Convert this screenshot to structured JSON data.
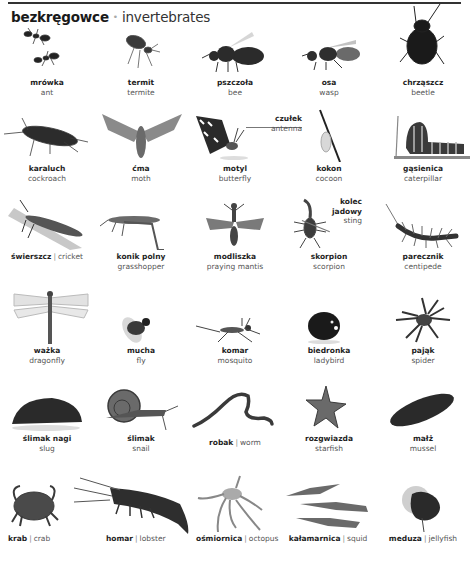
{
  "header": {
    "title_pl": "bezkręgowce",
    "bullet": "•",
    "title_en": "invertebrates"
  },
  "colors": {
    "text_primary": "#1e1e1e",
    "text_secondary": "#555555",
    "bullet": "#a9a9a9",
    "rule": "#333333"
  },
  "rows": [
    {
      "items": [
        {
          "pl": "mrówka",
          "en": "ant",
          "icon": "ant-image"
        },
        {
          "pl": "termit",
          "en": "termite",
          "icon": "termite-image"
        },
        {
          "pl": "pszczoła",
          "en": "bee",
          "icon": "bee-image"
        },
        {
          "pl": "osa",
          "en": "wasp",
          "icon": "wasp-image"
        },
        {
          "pl": "chrząszcz",
          "en": "beetle",
          "icon": "beetle-image"
        }
      ]
    },
    {
      "items": [
        {
          "pl": "karaluch",
          "en": "cockroach",
          "icon": "cockroach-image"
        },
        {
          "pl": "ćma",
          "en": "moth",
          "icon": "moth-image"
        },
        {
          "pl": "motyl",
          "en": "butterfly",
          "icon": "butterfly-image"
        },
        {
          "pl": "kokon",
          "en": "cocoon",
          "icon": "cocoon-image"
        },
        {
          "pl": "gąsienica",
          "en": "caterpillar",
          "icon": "caterpillar-image"
        }
      ]
    },
    {
      "items": [
        {
          "pl": "świerszcz",
          "en": "cricket",
          "icon": "cricket-image",
          "inline": true
        },
        {
          "pl": "konik polny",
          "en": "grasshopper",
          "icon": "grasshopper-image"
        },
        {
          "pl": "modliszka",
          "en": "praying mantis",
          "icon": "mantis-image"
        },
        {
          "pl": "skorpion",
          "en": "scorpion",
          "icon": "scorpion-image"
        },
        {
          "pl": "parecznik",
          "en": "centipede",
          "icon": "centipede-image"
        }
      ]
    },
    {
      "items": [
        {
          "pl": "ważka",
          "en": "dragonfly",
          "icon": "dragonfly-image"
        },
        {
          "pl": "mucha",
          "en": "fly",
          "icon": "fly-image"
        },
        {
          "pl": "komar",
          "en": "mosquito",
          "icon": "mosquito-image"
        },
        {
          "pl": "biedronka",
          "en": "ladybird",
          "icon": "ladybird-image"
        },
        {
          "pl": "pająk",
          "en": "spider",
          "icon": "spider-image"
        }
      ]
    },
    {
      "items": [
        {
          "pl": "ślimak nagi",
          "en": "slug",
          "icon": "slug-image"
        },
        {
          "pl": "ślimak",
          "en": "snail",
          "icon": "snail-image"
        },
        {
          "pl": "robak",
          "en": "worm",
          "icon": "worm-image",
          "inline": true
        },
        {
          "pl": "rozgwiazda",
          "en": "starfish",
          "icon": "starfish-image"
        },
        {
          "pl": "małż",
          "en": "mussel",
          "icon": "mussel-image"
        }
      ]
    },
    {
      "items": [
        {
          "pl": "krab",
          "en": "crab",
          "icon": "crab-image",
          "inline": true
        },
        {
          "pl": "homar",
          "en": "lobster",
          "icon": "lobster-image",
          "inline": true
        },
        {
          "pl": "ośmiornica",
          "en": "octopus",
          "icon": "octopus-image",
          "inline": true
        },
        {
          "pl": "kałamarnica",
          "en": "squid",
          "icon": "squid-image",
          "inline": true
        },
        {
          "pl": "meduza",
          "en": "jellyfish",
          "icon": "jellyfish-image",
          "inline": true
        }
      ]
    }
  ],
  "callouts": {
    "antenna": {
      "pl": "czułek",
      "en": "antenna"
    },
    "sting": {
      "pl_line1": "kolec",
      "pl_line2": "jadowy",
      "en": "sting"
    }
  },
  "separator": "|"
}
